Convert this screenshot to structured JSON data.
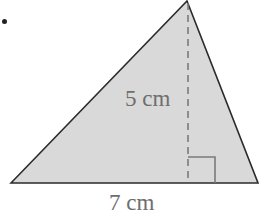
{
  "problem": {
    "bullet": "•"
  },
  "triangle": {
    "fill_color": "#d9d9d9",
    "stroke_color": "#2b2b2b",
    "vertices": {
      "apex": [
        187,
        1
      ],
      "base_left": [
        11,
        183
      ],
      "base_right": [
        258,
        183
      ]
    },
    "altitude": {
      "foot": [
        188,
        183
      ],
      "style": "dashed",
      "color": "#7a7a7a"
    },
    "right_angle_marker": {
      "size": 26,
      "color": "#7a7a7a"
    }
  },
  "labels": {
    "height": "5 cm",
    "base": "7 cm"
  },
  "dimensions": {
    "height_value": 5,
    "base_value": 7,
    "unit": "cm"
  }
}
